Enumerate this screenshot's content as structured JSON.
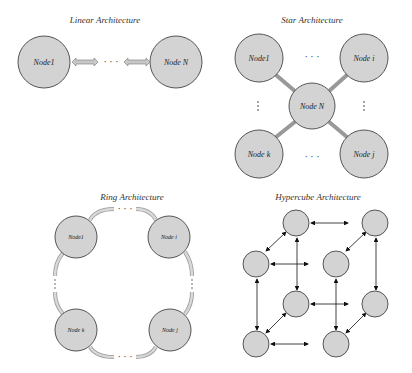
{
  "panels": {
    "linear": {
      "title": "Linear Architecture",
      "nodes": [
        "Node1",
        "Node N"
      ],
      "ellipsis": "· · ·"
    },
    "star": {
      "title": "Star Architecture",
      "nodes": [
        "Node1",
        "Node i",
        "Node N",
        "Node k",
        "Node j"
      ],
      "ellipsis": "· · ·"
    },
    "ring": {
      "title": "Ring Architecture",
      "nodes": [
        "Node1",
        "Node i",
        "Node k",
        "Node j"
      ],
      "ellipsis": "· · ·"
    },
    "hypercube": {
      "title": "Hypercube Architecture",
      "node_count": 8
    }
  },
  "colors": {
    "node_fill": "#d3d3d3",
    "node_stroke": "#555555",
    "arrow_fill": "#c8c8c8"
  }
}
